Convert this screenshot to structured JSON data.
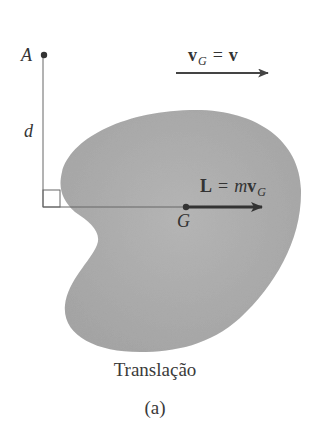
{
  "figure": {
    "caption": "Translação",
    "sublabel": "(a)"
  },
  "labels": {
    "point_A": "A",
    "distance": "d",
    "centroid": "G",
    "velocity": {
      "symbol": "v",
      "subscript": "G",
      "equals": "=",
      "rhs": "v"
    },
    "momentum": {
      "symbol": "L",
      "equals": "=",
      "rhs_coeff": "m",
      "rhs_vec": "v",
      "rhs_sub": "G"
    }
  },
  "colors": {
    "body_fill": "#a9a9a9",
    "body_fill_light": "#bdbdbd",
    "line": "#555555",
    "arrow": "#333333",
    "text": "#333333"
  },
  "geometry": {
    "point_A": [
      44,
      55
    ],
    "point_G": [
      186,
      207
    ],
    "perpendicular_foot": [
      43,
      207
    ],
    "right_angle_box_size": 17,
    "velocity_arrow": {
      "from": [
        176,
        73
      ],
      "to": [
        268,
        73
      ]
    },
    "momentum_arrow": {
      "from": [
        186,
        207
      ],
      "to": [
        262,
        207
      ]
    }
  }
}
